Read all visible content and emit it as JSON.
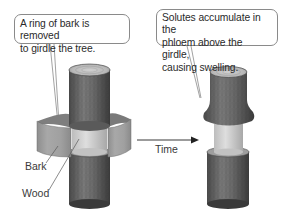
{
  "callouts": {
    "left": {
      "line1": "A ring of bark is removed",
      "line2": "to girdle the tree."
    },
    "right": {
      "line1": "Solutes accumulate in the",
      "line2": "phloem above the girdle,",
      "line3": "causing swelling."
    }
  },
  "labels": {
    "bark": "Bark",
    "wood": "Wood",
    "time": "Time"
  },
  "colors": {
    "bark_dark": "#3f3f3f",
    "bark_mid": "#6b6b6b",
    "bark_light": "#8c8c8c",
    "wood": "#d4d4d4",
    "wood_shade": "#b5b5b5",
    "bark_sheet": "#9a9a9a",
    "outline": "#8a8a8a"
  },
  "icons": {
    "arrow": "arrow-right-icon"
  }
}
